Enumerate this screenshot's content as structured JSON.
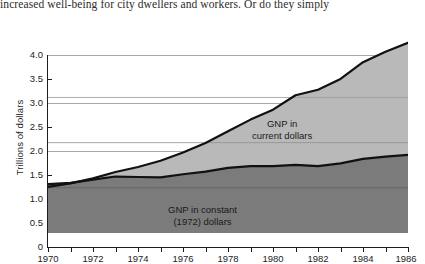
{
  "page": {
    "caption_text": "increased well-being for city dwellers and workers. Or do they simply"
  },
  "figure": {
    "y_axis_title": "Trillions of dollars",
    "series_labels": {
      "current": "GNP in\ncurrent dollars",
      "current_line1": "GNP in",
      "current_line2": "current dollars",
      "constant_line1": "GNP in constant",
      "constant_line2": "(1972) dollars"
    },
    "colors": {
      "constant_area": "#7b7b7b",
      "current_area": "#b9b9b9",
      "line": "#111111",
      "gridline": "#a9a9a9",
      "axis": "#1d1d1d",
      "background": "#ffffff"
    }
  },
  "chart_data": {
    "type": "area",
    "title": "",
    "subtitle": "",
    "xlabel": "",
    "ylabel": "Trillions of dollars",
    "xlim": [
      1970,
      1986
    ],
    "ylim": [
      0,
      4.25
    ],
    "grid": true,
    "gridlines_y": [
      1.0,
      2.0,
      3.0,
      4.0
    ],
    "legend_position": "inline-annotation",
    "stacked": false,
    "y_ticks": [
      0,
      0.5,
      1.0,
      1.5,
      2.0,
      2.5,
      3.0,
      3.5,
      4.0
    ],
    "y_tick_labels": [
      "0",
      "0.5",
      "1.0",
      "1.5",
      "2.0",
      "2.5",
      "3.0",
      "3.5",
      "4.0"
    ],
    "x_ticks": [
      1970,
      1971,
      1972,
      1973,
      1974,
      1975,
      1976,
      1977,
      1978,
      1979,
      1980,
      1981,
      1982,
      1983,
      1984,
      1985,
      1986
    ],
    "x_tick_labels": [
      "1970",
      "",
      "1972",
      "",
      "1974",
      "",
      "1976",
      "",
      "1978",
      "",
      "1980",
      "",
      "1982",
      "",
      "1984",
      "",
      "1986"
    ],
    "x": [
      1970,
      1971,
      1972,
      1973,
      1974,
      1975,
      1976,
      1977,
      1978,
      1979,
      1980,
      1981,
      1982,
      1983,
      1984,
      1985,
      1986
    ],
    "series": [
      {
        "name": "GNP in current dollars",
        "values": [
          1.02,
          1.1,
          1.21,
          1.35,
          1.46,
          1.6,
          1.78,
          1.99,
          2.25,
          2.51,
          2.73,
          3.05,
          3.17,
          3.41,
          3.78,
          4.01,
          4.21
        ]
      },
      {
        "name": "GNP in constant (1972) dollars",
        "values": [
          1.08,
          1.11,
          1.18,
          1.25,
          1.24,
          1.23,
          1.3,
          1.36,
          1.44,
          1.48,
          1.48,
          1.51,
          1.48,
          1.54,
          1.64,
          1.69,
          1.73
        ]
      }
    ]
  }
}
